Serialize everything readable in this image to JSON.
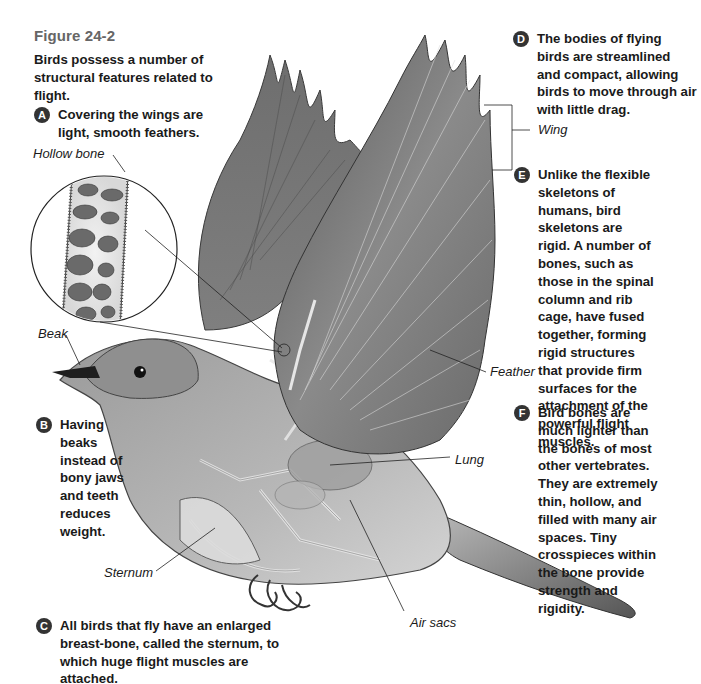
{
  "figure": {
    "title": "Figure 24-2",
    "caption": "Birds possess a number of structural features related to flight."
  },
  "callouts": [
    {
      "letter": "A",
      "text": "Covering the wings are light, smooth feathers."
    },
    {
      "letter": "B",
      "text": "Having beaks instead of bony jaws and teeth reduces weight."
    },
    {
      "letter": "C",
      "text": "All birds that fly have an enlarged breast-bone, called the sternum, to which huge flight muscles are attached."
    },
    {
      "letter": "D",
      "text": "The bodies of flying birds are streamlined and compact, allowing birds to move through air with little drag."
    },
    {
      "letter": "E",
      "text": "Unlike the flexible skeletons of humans, bird skeletons are rigid. A number of bones, such as those in the spinal column and rib cage, have fused together, forming rigid structures that provide firm surfaces for the attachment of the powerful flight muscles."
    },
    {
      "letter": "F",
      "text": "Bird bones are much lighter than the bones of most other vertebrates. They are extremely thin, hollow, and filled with many air spaces. Tiny crosspieces within the bone provide strength and rigidity."
    }
  ],
  "labels": {
    "hollow_bone": "Hollow bone",
    "beak": "Beak",
    "sternum": "Sternum",
    "air_sacs": "Air sacs",
    "wing": "Wing",
    "feather": "Feather",
    "lung": "Lung"
  },
  "colors": {
    "title_gray": "#666666",
    "badge": "#333333",
    "text": "#1a1a1a"
  }
}
